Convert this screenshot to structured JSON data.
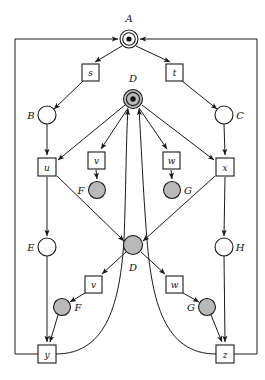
{
  "diagram": {
    "colors": {
      "stroke": "#1a1a1a",
      "place_fill_white": "#ffffff",
      "place_fill_gray": "#b9b9b9",
      "token_fill": "#111111",
      "background": "#ffffff"
    },
    "places": [
      {
        "id": "A",
        "label": "A",
        "fill": "white",
        "token": true,
        "cx": 129,
        "cy": 39,
        "r": 9,
        "label_x": 129,
        "label_y": 22,
        "label_anchor": "middle"
      },
      {
        "id": "B",
        "label": "B",
        "fill": "white",
        "token": false,
        "cx": 47,
        "cy": 115,
        "r": 9,
        "label_x": 31,
        "label_y": 119,
        "label_anchor": "middle"
      },
      {
        "id": "C",
        "label": "C",
        "fill": "white",
        "token": false,
        "cx": 224,
        "cy": 115,
        "r": 9,
        "label_x": 240,
        "label_y": 119,
        "label_anchor": "middle"
      },
      {
        "id": "D_top",
        "label": "D",
        "fill": "gray",
        "token": true,
        "cx": 133,
        "cy": 99,
        "r": 9.5,
        "label_x": 133,
        "label_y": 82,
        "label_anchor": "middle"
      },
      {
        "id": "F_upper",
        "label": "F",
        "fill": "gray",
        "token": false,
        "cx": 97,
        "cy": 190,
        "r": 8.5,
        "label_x": 81,
        "label_y": 194,
        "label_anchor": "middle"
      },
      {
        "id": "G_upper",
        "label": "G",
        "fill": "gray",
        "token": false,
        "cx": 172,
        "cy": 190,
        "r": 8.5,
        "label_x": 188,
        "label_y": 194,
        "label_anchor": "middle"
      },
      {
        "id": "E",
        "label": "E",
        "fill": "white",
        "token": false,
        "cx": 47,
        "cy": 247,
        "r": 9,
        "label_x": 31,
        "label_y": 251,
        "label_anchor": "middle"
      },
      {
        "id": "H",
        "label": "H",
        "fill": "white",
        "token": false,
        "cx": 224,
        "cy": 247,
        "r": 9,
        "label_x": 240,
        "label_y": 251,
        "label_anchor": "middle"
      },
      {
        "id": "D_mid",
        "label": "D",
        "fill": "gray",
        "token": false,
        "cx": 133,
        "cy": 245,
        "r": 9.5,
        "label_x": 133,
        "label_y": 271,
        "label_anchor": "middle"
      },
      {
        "id": "F_lower",
        "label": "F",
        "fill": "gray",
        "token": false,
        "cx": 62,
        "cy": 307,
        "r": 8.5,
        "label_x": 78,
        "label_y": 311,
        "label_anchor": "middle"
      },
      {
        "id": "G_lower",
        "label": "G",
        "fill": "gray",
        "token": false,
        "cx": 207,
        "cy": 307,
        "r": 8.5,
        "label_x": 191,
        "label_y": 311,
        "label_anchor": "middle"
      }
    ],
    "transitions": [
      {
        "id": "s",
        "label": "s",
        "x": 82,
        "y": 64,
        "w": 17,
        "h": 17
      },
      {
        "id": "t",
        "label": "t",
        "x": 166,
        "y": 64,
        "w": 17,
        "h": 17
      },
      {
        "id": "u",
        "label": "u",
        "x": 38,
        "y": 158,
        "w": 18,
        "h": 18
      },
      {
        "id": "v_upper",
        "label": "v",
        "x": 88,
        "y": 152,
        "w": 17,
        "h": 17
      },
      {
        "id": "w_upper",
        "label": "w",
        "x": 163,
        "y": 152,
        "w": 17,
        "h": 17
      },
      {
        "id": "x",
        "label": "x",
        "x": 216,
        "y": 158,
        "w": 18,
        "h": 18
      },
      {
        "id": "v_lower",
        "label": "v",
        "x": 85,
        "y": 276,
        "w": 17,
        "h": 17
      },
      {
        "id": "w_lower",
        "label": "w",
        "x": 166,
        "y": 276,
        "w": 17,
        "h": 17
      },
      {
        "id": "y",
        "label": "y",
        "x": 38,
        "y": 345,
        "w": 18,
        "h": 18
      },
      {
        "id": "z",
        "label": "z",
        "x": 216,
        "y": 345,
        "w": 18,
        "h": 18
      }
    ],
    "arcs": [
      {
        "id": "arc-A-s",
        "from": "A",
        "to": "s"
      },
      {
        "id": "arc-A-t",
        "from": "A",
        "to": "t"
      },
      {
        "id": "arc-s-B",
        "from": "s",
        "to": "B"
      },
      {
        "id": "arc-t-C",
        "from": "t",
        "to": "C"
      },
      {
        "id": "arc-B-u",
        "from": "B",
        "to": "u"
      },
      {
        "id": "arc-C-x",
        "from": "C",
        "to": "x"
      },
      {
        "id": "arc-Dtop-u",
        "from": "D_top",
        "to": "u"
      },
      {
        "id": "arc-Dtop-vupper",
        "from": "D_top",
        "to": "v_upper"
      },
      {
        "id": "arc-Dtop-wupper",
        "from": "D_top",
        "to": "w_upper"
      },
      {
        "id": "arc-Dtop-x",
        "from": "D_top",
        "to": "x"
      },
      {
        "id": "arc-vupper-Fupper",
        "from": "v_upper",
        "to": "F_upper"
      },
      {
        "id": "arc-wupper-Gupper",
        "from": "w_upper",
        "to": "G_upper"
      },
      {
        "id": "arc-u-E",
        "from": "u",
        "to": "E"
      },
      {
        "id": "arc-x-H",
        "from": "x",
        "to": "H"
      },
      {
        "id": "arc-u-Dmid",
        "from": "u",
        "to": "D_mid"
      },
      {
        "id": "arc-x-Dmid",
        "from": "x",
        "to": "D_mid"
      },
      {
        "id": "arc-Dmid-vlower",
        "from": "D_mid",
        "to": "v_lower"
      },
      {
        "id": "arc-Dmid-wlower",
        "from": "D_mid",
        "to": "w_lower"
      },
      {
        "id": "arc-vlower-Flower",
        "from": "v_lower",
        "to": "F_lower"
      },
      {
        "id": "arc-wlower-Glower",
        "from": "w_lower",
        "to": "G_lower"
      },
      {
        "id": "arc-E-y",
        "from": "E",
        "to": "y"
      },
      {
        "id": "arc-H-z",
        "from": "H",
        "to": "z"
      },
      {
        "id": "arc-Flower-y",
        "from": "F_lower",
        "to": "y"
      },
      {
        "id": "arc-Glower-z",
        "from": "G_lower",
        "to": "z"
      },
      {
        "id": "arc-y-Dtop",
        "from": "y",
        "to": "D_top",
        "curved": true
      },
      {
        "id": "arc-z-Dtop",
        "from": "z",
        "to": "D_top",
        "curved": true
      },
      {
        "id": "arc-y-A",
        "from": "y",
        "to": "A",
        "routed": true
      },
      {
        "id": "arc-z-A",
        "from": "z",
        "to": "A",
        "routed": true
      }
    ]
  }
}
